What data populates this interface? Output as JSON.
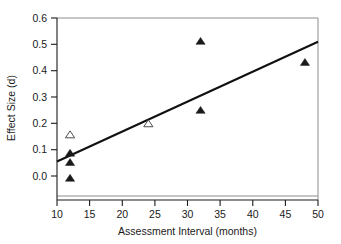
{
  "chart_data": {
    "type": "scatter",
    "title": "",
    "xlabel": "Assessment Interval (months)",
    "ylabel": "Effect Size (d)",
    "xlim": [
      10,
      50
    ],
    "ylim": [
      -0.04,
      0.6
    ],
    "xticks": [
      10,
      15,
      20,
      25,
      30,
      35,
      40,
      45,
      50
    ],
    "xtick_labels": [
      "10",
      "15",
      "20",
      "25",
      "30",
      "35",
      "40",
      "45",
      "50"
    ],
    "yticks": [
      0.0,
      0.1,
      0.2,
      0.3,
      0.4,
      0.5,
      0.6
    ],
    "ytick_labels": [
      "0.0",
      "0.1",
      "0.2",
      "0.3",
      "0.4",
      "0.5",
      "0.6"
    ],
    "grid": false,
    "legend": false,
    "series": [
      {
        "name": "filled-triangle",
        "marker": "filled-triangle",
        "points": [
          {
            "x": 12,
            "y": -0.01
          },
          {
            "x": 12,
            "y": 0.05
          },
          {
            "x": 12,
            "y": 0.085
          },
          {
            "x": 32,
            "y": 0.248
          },
          {
            "x": 32,
            "y": 0.51
          },
          {
            "x": 48,
            "y": 0.43
          }
        ]
      },
      {
        "name": "open-triangle",
        "marker": "open-triangle",
        "points": [
          {
            "x": 12,
            "y": 0.155
          },
          {
            "x": 24,
            "y": 0.197
          }
        ]
      }
    ],
    "trendline": {
      "name": "regression-line",
      "x_start": 10,
      "y_start": 0.055,
      "x_end": 50,
      "y_end": 0.51
    },
    "colors": {
      "marker_fill": "#1a1a1a",
      "marker_open_fill": "#ffffff",
      "trendline": "#111111",
      "axis": "#1a1a1a",
      "frame": "#8c8c8c",
      "background": "#ffffff"
    }
  }
}
